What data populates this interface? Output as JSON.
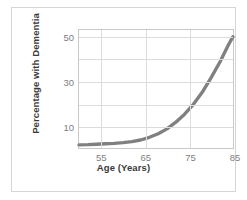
{
  "chart_data": {
    "type": "line",
    "title": "",
    "xlabel": "Age (Years)",
    "ylabel": "Percentage with Dementia",
    "xlim": [
      50,
      85
    ],
    "ylim": [
      0,
      53
    ],
    "grid": true,
    "legend": "none",
    "line_color": "#808080",
    "xticks": [
      55,
      65,
      75,
      85
    ],
    "xtick_labels": [
      "55",
      "65",
      "75",
      "85"
    ],
    "yticks": [
      10,
      30,
      50
    ],
    "ytick_labels": [
      "10",
      "30",
      "50"
    ],
    "ygridlines": [
      10,
      20,
      30,
      40,
      50
    ],
    "series": [
      {
        "name": "Percentage with Dementia",
        "x": [
          50,
          52,
          54,
          56,
          58,
          60,
          62,
          64,
          66,
          68,
          70,
          72,
          74,
          76,
          78,
          80,
          82,
          84,
          85
        ],
        "y": [
          1.4,
          1.5,
          1.7,
          1.9,
          2.1,
          2.4,
          2.9,
          3.6,
          4.8,
          6.4,
          8.6,
          11.6,
          15.2,
          19.6,
          25.0,
          31.5,
          38.5,
          46.5,
          50.0
        ]
      }
    ]
  },
  "figure": {
    "frame_color": "#d6d6d6",
    "plot_border_color": "#c9c9c9",
    "grid_color": "#dcdcdc",
    "tick_label_color": "#808080",
    "axis_title_color": "#3a3a3a",
    "background": "#ffffff"
  }
}
